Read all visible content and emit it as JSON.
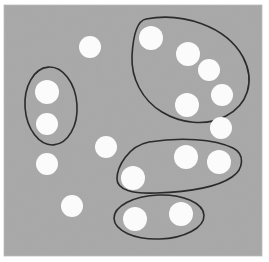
{
  "figure": {
    "width": 269,
    "height": 262,
    "plot_area": {
      "x": 4,
      "y": 5,
      "width": 258,
      "height": 251
    },
    "colors": {
      "page_background": "#ffffff",
      "plot_background": "#a8a8a8",
      "point_fill": "#fbfbfb",
      "boundary_stroke": "#2b2b2b",
      "plot_border": "#c9c9c9"
    },
    "style": {
      "point_radius": 11,
      "boundary_stroke_width": 1.6
    }
  },
  "chart_data": {
    "type": "scatter",
    "title": "",
    "xlabel": "",
    "ylabel": "",
    "xlim": [
      4,
      262
    ],
    "ylim": [
      5,
      256
    ],
    "grid": false,
    "legend": null,
    "point_count": 16,
    "cluster_count": 4,
    "unclustered_count": 6,
    "points": [
      {
        "id": "p1",
        "x": 90,
        "y": 47,
        "r": 11,
        "cluster": null
      },
      {
        "id": "p2",
        "x": 47,
        "y": 92,
        "r": 12,
        "cluster": "c-left"
      },
      {
        "id": "p3",
        "x": 47,
        "y": 124,
        "r": 11,
        "cluster": "c-left"
      },
      {
        "id": "p4",
        "x": 47,
        "y": 164,
        "r": 11,
        "cluster": null
      },
      {
        "id": "p5",
        "x": 106,
        "y": 147,
        "r": 11,
        "cluster": null
      },
      {
        "id": "p6",
        "x": 72,
        "y": 206,
        "r": 11,
        "cluster": null
      },
      {
        "id": "p7",
        "x": 151,
        "y": 38,
        "r": 12,
        "cluster": "c-top-right"
      },
      {
        "id": "p8",
        "x": 188,
        "y": 54,
        "r": 12,
        "cluster": "c-top-right"
      },
      {
        "id": "p9",
        "x": 209,
        "y": 70,
        "r": 11,
        "cluster": "c-top-right"
      },
      {
        "id": "p10",
        "x": 222,
        "y": 95,
        "r": 11,
        "cluster": "c-top-right"
      },
      {
        "id": "p11",
        "x": 187,
        "y": 105,
        "r": 12,
        "cluster": "c-top-right"
      },
      {
        "id": "p12",
        "x": 221,
        "y": 128,
        "r": 11,
        "cluster": null
      },
      {
        "id": "p13",
        "x": 133,
        "y": 178,
        "r": 12,
        "cluster": "c-middle"
      },
      {
        "id": "p14",
        "x": 186,
        "y": 157,
        "r": 12,
        "cluster": "c-middle"
      },
      {
        "id": "p15",
        "x": 219,
        "y": 162,
        "r": 12,
        "cluster": "c-middle"
      },
      {
        "id": "p16",
        "x": 135,
        "y": 219,
        "r": 12,
        "cluster": "c-bottom"
      },
      {
        "id": "p17",
        "x": 181,
        "y": 214,
        "r": 12,
        "cluster": "c-bottom"
      }
    ],
    "clusters": [
      {
        "id": "c-left",
        "label": "left-pair-cluster",
        "shape": "ellipse",
        "members": [
          "p2",
          "p3"
        ],
        "member_count": 2,
        "bounds": {
          "cx": 51,
          "cy": 106,
          "rx": 26,
          "ry": 39
        },
        "rotation_deg": -4
      },
      {
        "id": "c-top-right",
        "label": "top-right-blob-cluster",
        "shape": "blob",
        "members": [
          "p7",
          "p8",
          "p9",
          "p10",
          "p11"
        ],
        "member_count": 5,
        "bounds": {
          "cx": 189,
          "cy": 69,
          "rx": 59,
          "ry": 53
        },
        "path": "M 146 19 C 182 12, 226 26, 243 57 C 256 82, 247 105, 226 116 C 206 127, 180 123, 162 112 C 142 100, 131 78, 132 56 C 133 37, 136 21, 146 19 Z"
      },
      {
        "id": "c-middle",
        "label": "middle-band-cluster",
        "shape": "blob",
        "members": [
          "p13",
          "p14",
          "p15"
        ],
        "member_count": 3,
        "bounds": {
          "cx": 178,
          "cy": 167,
          "rx": 62,
          "ry": 28
        },
        "path": "M 149 142 C 181 137, 214 139, 233 148 C 245 154, 244 169, 232 177 C 216 188, 186 192, 156 193 C 133 194, 117 190, 117 179 C 117 167, 128 146, 149 142 Z"
      },
      {
        "id": "c-bottom",
        "label": "bottom-pair-cluster",
        "shape": "ellipse",
        "members": [
          "p16",
          "p17"
        ],
        "member_count": 2,
        "bounds": {
          "cx": 159,
          "cy": 217,
          "rx": 45,
          "ry": 22
        },
        "rotation_deg": -2
      }
    ]
  }
}
